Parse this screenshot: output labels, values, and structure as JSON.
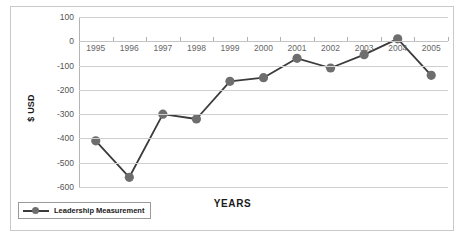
{
  "chart_data": {
    "type": "line",
    "title": "",
    "xlabel": "YEARS",
    "ylabel": "$ USD",
    "categories": [
      "1995",
      "1996",
      "1997",
      "1998",
      "1999",
      "2000",
      "2001",
      "2002",
      "2003",
      "2004",
      "2005"
    ],
    "series": [
      {
        "name": "Leadership Measurement",
        "values": [
          -410,
          -560,
          -300,
          -320,
          -165,
          -150,
          -70,
          -110,
          -55,
          10,
          -140
        ]
      }
    ],
    "ylim": [
      -600,
      100
    ],
    "yticks": [
      100,
      0,
      -100,
      -200,
      -300,
      -400,
      -500,
      -600
    ],
    "ytick_labels": [
      "100",
      "0",
      "-100",
      "-200",
      "-300",
      "-400",
      "-500",
      "-600"
    ],
    "grid": true,
    "legend_position": "bottom-left",
    "colors": {
      "line": "#3b3b3b",
      "marker": "#6e6e6e",
      "grid": "#cfcfcf",
      "axis": "#b5b5b5",
      "frame": "#c9c9c9",
      "text": "#1a1a1a",
      "tick_text": "#666666"
    }
  },
  "legend": {
    "label": "Leadership Measurement"
  }
}
